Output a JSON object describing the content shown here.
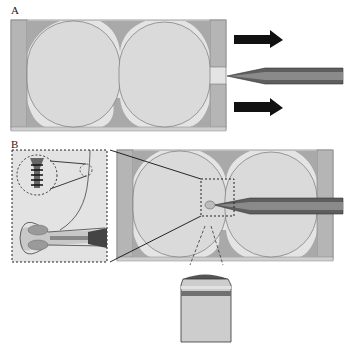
{
  "figure": {
    "panels": [
      {
        "id": "A",
        "label": "A",
        "description": "Two large spheres packed in a rectangular channel with a pipette tip at the right opening; arrows indicate flow direction"
      },
      {
        "id": "B",
        "label": "B",
        "description": "Same channel with pipette tip inserted at the junction between spheres; insets show magnified neck region and a cylindrical side view"
      }
    ],
    "colors": {
      "channel_wall": "#b4b4b4",
      "channel_fill": "#e6e6e6",
      "sphere_fill": "#dcdcdc",
      "interstitial": "#a8a8a8",
      "pipette": "#6a6a6a",
      "arrow": "#111111",
      "inset_bg": "#e2e2e2"
    }
  }
}
